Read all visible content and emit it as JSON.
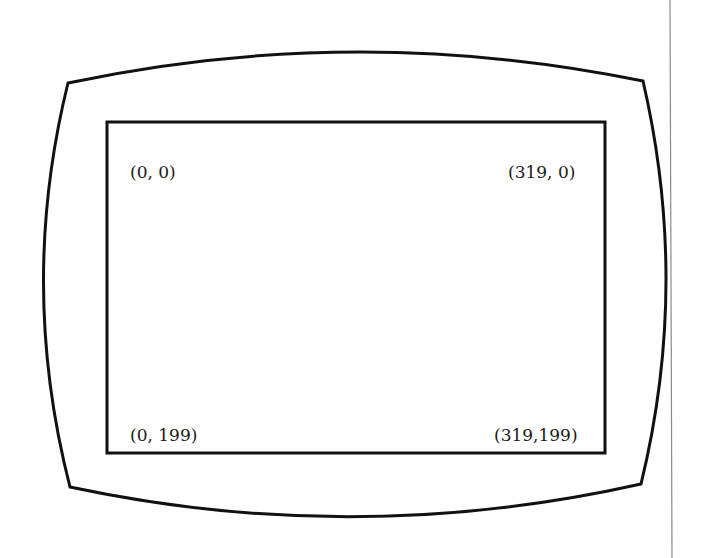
{
  "diagram": {
    "shape": "crt-monitor-outline",
    "corner_labels": {
      "top_left": "(0, 0)",
      "top_right": "(319, 0)",
      "bottom_left": "(0, 199)",
      "bottom_right": "(319,199)"
    },
    "colors": {
      "stroke": "#111111",
      "background": "#ffffff",
      "margin_rule": "#8a8a8a"
    }
  }
}
